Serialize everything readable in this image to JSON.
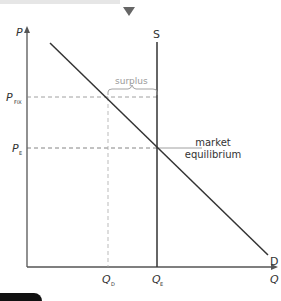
{
  "diagram": {
    "axes": {
      "y_label": "P",
      "x_label": "Q"
    },
    "curves": {
      "supply": "S",
      "demand": "D"
    },
    "price_labels": {
      "fixed_main": "P",
      "fixed_sub": "FIX",
      "eq_main": "P",
      "eq_sub": "E"
    },
    "quantity_labels": {
      "qd_main": "Q",
      "qd_sub": "D",
      "qe_main": "Q",
      "qe_sub": "E"
    },
    "annotations": {
      "surplus": "surplus",
      "market1": "market",
      "market2": "equilibrium"
    },
    "colors": {
      "axis": "#555555",
      "curve": "#333333",
      "dashed": "#888888",
      "label": "#333333",
      "surplus": "#999999",
      "marker": "#666666"
    }
  }
}
